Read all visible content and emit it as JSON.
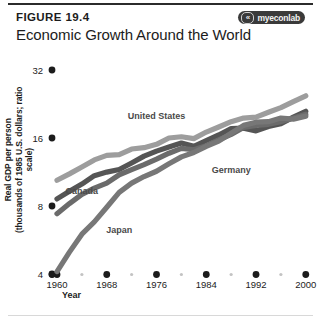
{
  "figure": {
    "number": "FIGURE 19.4",
    "title": "Economic Growth Around the World",
    "logo_text": "myeconlab",
    "logo_mark": "«"
  },
  "chart_data": {
    "type": "line",
    "title": "Economic Growth Around the World",
    "xlabel": "Year",
    "ylabel": "Real GDP per person (thousands of 1985 U.S. dollars; ratio scale)",
    "ylabel_line1": "Real GDP per person",
    "ylabel_line2": "(thousands of 1985 U.S. dollars; ratio scale)",
    "scale": "log",
    "grid": false,
    "legend_position": "inline-annotations",
    "xlim": [
      1960,
      2001
    ],
    "ylim": [
      4,
      32
    ],
    "x_ticks": [
      1960,
      1968,
      1976,
      1984,
      1992,
      2000
    ],
    "x_tick_labels": [
      "1960",
      "1968",
      "1976",
      "1984",
      "1992",
      "2000"
    ],
    "y_ticks": [
      4,
      8,
      16,
      32
    ],
    "y_tick_labels": [
      "4",
      "8",
      "16",
      "32"
    ],
    "x": [
      1960,
      1962,
      1964,
      1966,
      1968,
      1970,
      1972,
      1974,
      1976,
      1978,
      1980,
      1982,
      1984,
      1986,
      1988,
      1990,
      1992,
      1994,
      1996,
      1998,
      2000
    ],
    "series": [
      {
        "name": "United States",
        "label": "United States",
        "color": "#9d9d9d",
        "values": [
          10.4,
          11.1,
          11.9,
          12.8,
          13.4,
          13.5,
          14.3,
          14.5,
          15.0,
          16.0,
          16.2,
          15.9,
          17.0,
          17.9,
          18.9,
          19.6,
          19.8,
          20.8,
          21.8,
          23.2,
          24.6
        ]
      },
      {
        "name": "Canada",
        "label": "Canada",
        "color": "#555555",
        "values": [
          8.6,
          9.3,
          10.0,
          10.9,
          11.3,
          11.6,
          12.4,
          13.3,
          14.0,
          14.6,
          15.2,
          14.7,
          15.6,
          16.5,
          17.6,
          17.7,
          17.2,
          18.0,
          18.5,
          19.8,
          21.0
        ]
      },
      {
        "name": "Germany",
        "label": "Germany",
        "color": "#6b6b6b",
        "values": [
          7.4,
          8.2,
          9.0,
          9.6,
          10.1,
          11.0,
          11.6,
          12.2,
          12.9,
          13.7,
          14.4,
          14.2,
          14.8,
          15.7,
          16.6,
          17.8,
          18.2,
          18.4,
          18.9,
          19.6,
          20.4
        ]
      },
      {
        "name": "Japan",
        "label": "Japan",
        "color": "#777777",
        "values": [
          4.1,
          5.0,
          6.0,
          6.8,
          7.9,
          9.2,
          10.1,
          10.8,
          11.4,
          12.3,
          13.2,
          13.8,
          14.7,
          15.5,
          16.8,
          18.2,
          18.8,
          18.9,
          19.6,
          19.4,
          20.0
        ]
      }
    ],
    "annotations": [
      {
        "text": "United States",
        "x": 1976,
        "y": 19.5
      },
      {
        "text": "Germany",
        "x": 1988,
        "y": 11.2
      },
      {
        "text": "Canada",
        "x": 1964,
        "y": 9.0
      },
      {
        "text": "Japan",
        "x": 1970,
        "y": 6.1
      }
    ]
  }
}
